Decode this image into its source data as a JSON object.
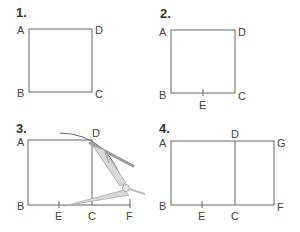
{
  "panels": [
    {
      "step": "1.",
      "labels": {
        "A": "A",
        "B": "B",
        "C": "C",
        "D": "D"
      }
    },
    {
      "step": "2.",
      "labels": {
        "A": "A",
        "B": "B",
        "C": "C",
        "D": "D",
        "E": "E"
      }
    },
    {
      "step": "3.",
      "labels": {
        "A": "A",
        "B": "B",
        "C": "C",
        "D": "D",
        "E": "E",
        "F": "F"
      },
      "tool": "compass"
    },
    {
      "step": "4.",
      "labels": {
        "A": "A",
        "B": "B",
        "C": "C",
        "D": "D",
        "E": "E",
        "F": "F",
        "G": "G"
      }
    }
  ],
  "colors": {
    "line": "#666666",
    "text": "#444444",
    "compass": "#9a9a9a",
    "compass_light": "#d0d0d0"
  }
}
